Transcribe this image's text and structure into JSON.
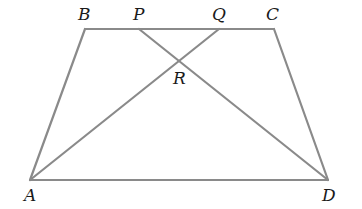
{
  "diagram": {
    "type": "trapezoid with intersecting diagonals",
    "line_color": "#8a8a8a",
    "label_color": "#1a1a1a",
    "points": {
      "A": {
        "label": "A",
        "x": 30,
        "y": 180,
        "lx": 24,
        "ly": 201
      },
      "B": {
        "label": "B",
        "x": 85,
        "y": 29,
        "lx": 78,
        "ly": 20
      },
      "P": {
        "label": "P",
        "x": 139,
        "y": 29,
        "lx": 133,
        "ly": 20
      },
      "Q": {
        "label": "Q",
        "x": 219,
        "y": 29,
        "lx": 212,
        "ly": 20
      },
      "C": {
        "label": "C",
        "x": 274,
        "y": 29,
        "lx": 266,
        "ly": 20
      },
      "R": {
        "label": "R",
        "x": 178,
        "y": 62,
        "lx": 173,
        "ly": 84
      },
      "D": {
        "label": "D",
        "x": 328,
        "y": 180,
        "lx": 322,
        "ly": 201
      }
    },
    "segments": [
      {
        "from": "A",
        "to": "B"
      },
      {
        "from": "B",
        "to": "C"
      },
      {
        "from": "C",
        "to": "D"
      },
      {
        "from": "A",
        "to": "D"
      },
      {
        "from": "A",
        "to": "Q"
      },
      {
        "from": "P",
        "to": "D"
      }
    ]
  }
}
